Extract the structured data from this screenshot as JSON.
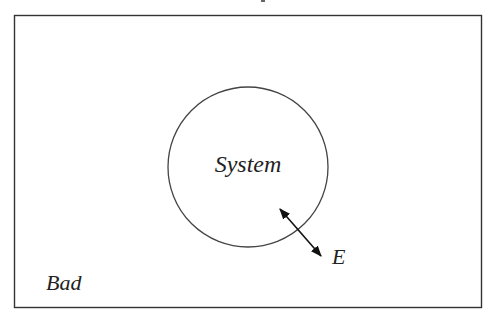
{
  "diagram": {
    "type": "system-surroundings",
    "frame": {
      "x": 14,
      "y": 15,
      "width": 468,
      "height": 293,
      "stroke": "#333333"
    },
    "system": {
      "label": "System",
      "circle": {
        "cx": 248,
        "cy": 167,
        "r": 80,
        "stroke": "#444444"
      }
    },
    "surroundings": {
      "label": "Bad"
    },
    "exchange": {
      "label": "E",
      "arrow": {
        "x1": 278,
        "y1": 207,
        "x2": 322,
        "y2": 257,
        "style": "double-headed"
      }
    }
  }
}
